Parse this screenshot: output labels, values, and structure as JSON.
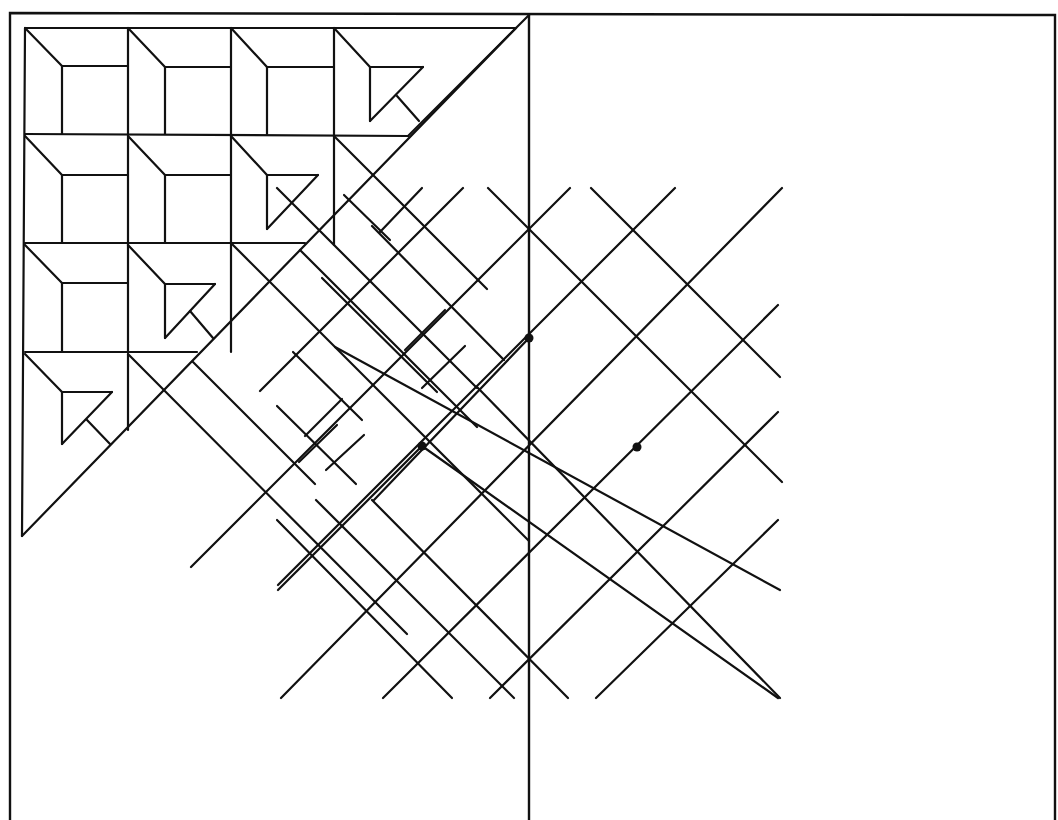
{
  "diagram": {
    "stroke_color": "#111111",
    "background": "#ffffff",
    "frame": {
      "outer": [
        [
          10,
          13
        ],
        [
          1055,
          15
        ],
        [
          1055,
          820
        ],
        [
          10,
          820
        ]
      ],
      "center_divider": [
        [
          529,
          15
        ],
        [
          529,
          820
        ]
      ]
    },
    "triangle_grid": {
      "origin": [
        25,
        28
      ],
      "cell": 103,
      "rows": [
        {
          "row": 0,
          "cells": [
            "bevel-square",
            "bevel-square",
            "bevel-square",
            "bevel-triangle"
          ]
        },
        {
          "row": 1,
          "cells": [
            "bevel-square",
            "bevel-square",
            "bevel-triangle",
            "corner"
          ]
        },
        {
          "row": 2,
          "cells": [
            "bevel-square",
            "bevel-triangle",
            "corner"
          ]
        },
        {
          "row": 3,
          "cells": [
            "bevel-triangle",
            "corner"
          ]
        }
      ],
      "hypotenuse": [
        [
          516,
          28
        ],
        [
          22,
          536
        ]
      ]
    },
    "dots": [
      [
        529,
        338
      ],
      [
        422,
        446
      ],
      [
        637,
        447
      ]
    ],
    "segments": [
      [
        [
          25,
          28
        ],
        [
          516,
          28
        ]
      ],
      [
        [
          25,
          28
        ],
        [
          22,
          536
        ]
      ],
      [
        [
          22,
          536
        ],
        [
          516,
          28
        ]
      ],
      [
        [
          128,
          28
        ],
        [
          128,
          352
        ]
      ],
      [
        [
          231,
          28
        ],
        [
          231,
          352
        ]
      ],
      [
        [
          334,
          28
        ],
        [
          334,
          245
        ]
      ],
      [
        [
          25,
          134
        ],
        [
          408,
          136
        ]
      ],
      [
        [
          25,
          243
        ],
        [
          305,
          243
        ]
      ],
      [
        [
          25,
          352
        ],
        [
          197,
          352
        ]
      ],
      [
        [
          25,
          28
        ],
        [
          62,
          66
        ]
      ],
      [
        [
          62,
          66
        ],
        [
          128,
          66
        ]
      ],
      [
        [
          62,
          66
        ],
        [
          62,
          134
        ]
      ],
      [
        [
          128,
          28
        ],
        [
          165,
          67
        ]
      ],
      [
        [
          165,
          67
        ],
        [
          231,
          67
        ]
      ],
      [
        [
          165,
          67
        ],
        [
          165,
          134
        ]
      ],
      [
        [
          231,
          28
        ],
        [
          267,
          67
        ]
      ],
      [
        [
          267,
          67
        ],
        [
          334,
          67
        ]
      ],
      [
        [
          267,
          67
        ],
        [
          267,
          134
        ]
      ],
      [
        [
          334,
          28
        ],
        [
          370,
          67
        ]
      ],
      [
        [
          370,
          67
        ],
        [
          423,
          67
        ]
      ],
      [
        [
          370,
          67
        ],
        [
          370,
          121
        ]
      ],
      [
        [
          370,
          121
        ],
        [
          423,
          67
        ]
      ],
      [
        [
          397,
          96
        ],
        [
          419,
          121
        ]
      ],
      [
        [
          25,
          136
        ],
        [
          62,
          175
        ]
      ],
      [
        [
          62,
          175
        ],
        [
          128,
          175
        ]
      ],
      [
        [
          62,
          175
        ],
        [
          62,
          243
        ]
      ],
      [
        [
          128,
          136
        ],
        [
          165,
          175
        ]
      ],
      [
        [
          165,
          175
        ],
        [
          231,
          175
        ]
      ],
      [
        [
          165,
          175
        ],
        [
          165,
          243
        ]
      ],
      [
        [
          231,
          136
        ],
        [
          267,
          175
        ]
      ],
      [
        [
          267,
          175
        ],
        [
          318,
          175
        ]
      ],
      [
        [
          267,
          175
        ],
        [
          267,
          229
        ]
      ],
      [
        [
          267,
          229
        ],
        [
          318,
          175
        ]
      ],
      [
        [
          25,
          245
        ],
        [
          62,
          283
        ]
      ],
      [
        [
          62,
          283
        ],
        [
          128,
          283
        ]
      ],
      [
        [
          62,
          283
        ],
        [
          62,
          352
        ]
      ],
      [
        [
          128,
          245
        ],
        [
          165,
          284
        ]
      ],
      [
        [
          165,
          284
        ],
        [
          215,
          284
        ]
      ],
      [
        [
          165,
          284
        ],
        [
          165,
          338
        ]
      ],
      [
        [
          165,
          338
        ],
        [
          215,
          284
        ]
      ],
      [
        [
          190,
          311
        ],
        [
          213,
          338
        ]
      ],
      [
        [
          25,
          354
        ],
        [
          62,
          392
        ]
      ],
      [
        [
          62,
          392
        ],
        [
          112,
          392
        ]
      ],
      [
        [
          62,
          392
        ],
        [
          62,
          444
        ]
      ],
      [
        [
          62,
          444
        ],
        [
          112,
          392
        ]
      ],
      [
        [
          87,
          420
        ],
        [
          110,
          444
        ]
      ],
      [
        [
          128,
          354
        ],
        [
          128,
          430
        ]
      ],
      [
        [
          128,
          354
        ],
        [
          407,
          634
        ]
      ],
      [
        [
          334,
          136
        ],
        [
          487,
          289
        ]
      ],
      [
        [
          231,
          243
        ],
        [
          529,
          541
        ]
      ],
      [
        [
          277,
          188
        ],
        [
          477,
          388
        ]
      ],
      [
        [
          372,
          226
        ],
        [
          504,
          360
        ]
      ],
      [
        [
          300,
          250
        ],
        [
          477,
          427
        ]
      ],
      [
        [
          193,
          362
        ],
        [
          315,
          484
        ]
      ],
      [
        [
          293,
          352
        ],
        [
          362,
          420
        ]
      ],
      [
        [
          277,
          406
        ],
        [
          356,
          484
        ]
      ],
      [
        [
          344,
          195
        ],
        [
          390,
          240
        ]
      ],
      [
        [
          322,
          278
        ],
        [
          437,
          392
        ]
      ],
      [
        [
          445,
          310
        ],
        [
          405,
          350
        ]
      ],
      [
        [
          465,
          346
        ],
        [
          422,
          388
        ]
      ],
      [
        [
          342,
          399
        ],
        [
          305,
          436
        ]
      ],
      [
        [
          337,
          425
        ],
        [
          299,
          462
        ]
      ],
      [
        [
          364,
          435
        ],
        [
          326,
          470
        ]
      ],
      [
        [
          408,
          136
        ],
        [
          529,
          15
        ]
      ],
      [
        [
          422,
          188
        ],
        [
          380,
          232
        ]
      ],
      [
        [
          488,
          188
        ],
        [
          529,
          229
        ]
      ],
      [
        [
          529,
          229
        ],
        [
          782,
          482
        ]
      ],
      [
        [
          463,
          188
        ],
        [
          260,
          391
        ]
      ],
      [
        [
          570,
          188
        ],
        [
          191,
          567
        ]
      ],
      [
        [
          675,
          188
        ],
        [
          278,
          585
        ]
      ],
      [
        [
          782,
          188
        ],
        [
          281,
          698
        ]
      ],
      [
        [
          778,
          305
        ],
        [
          383,
          698
        ]
      ],
      [
        [
          778,
          412
        ],
        [
          490,
          698
        ]
      ],
      [
        [
          778,
          520
        ],
        [
          596,
          698
        ]
      ],
      [
        [
          591,
          188
        ],
        [
          780,
          377
        ]
      ],
      [
        [
          335,
          347
        ],
        [
          780,
          590
        ]
      ],
      [
        [
          422,
          446
        ],
        [
          778,
          698
        ]
      ],
      [
        [
          316,
          500
        ],
        [
          514,
          698
        ]
      ],
      [
        [
          277,
          520
        ],
        [
          452,
          698
        ]
      ],
      [
        [
          372,
          500
        ],
        [
          568,
          698
        ]
      ],
      [
        [
          477,
          387
        ],
        [
          780,
          698
        ]
      ],
      [
        [
          422,
          446
        ],
        [
          278,
          590
        ]
      ],
      [
        [
          529,
          338
        ],
        [
          374,
          500
        ]
      ]
    ]
  }
}
